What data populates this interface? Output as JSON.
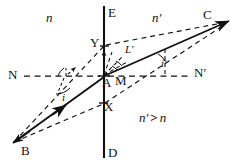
{
  "figure": {
    "background_color": "#ffffff",
    "ink_color": "#111111",
    "width": 232,
    "height": 165
  },
  "labels": {
    "interface_top": "E",
    "interface_bottom": "D",
    "normal_left": "N",
    "normal_right": "N′",
    "point_incident": "B",
    "point_refracted": "C",
    "point_upper": "Y",
    "point_vertex": "A",
    "point_mid": "M",
    "point_lower": "X",
    "index_left": "n",
    "index_right": "n′",
    "angle_incidence_upper": "i",
    "angle_incidence_lower": "i",
    "angle_refraction_upper": "L′",
    "angle_refraction_lower": "i′",
    "relation": "n′ > n",
    "relation_left": "n′",
    "relation_op": ">",
    "relation_right": "n"
  },
  "geometry": {
    "interface_x": 104,
    "interface_y_top": 6,
    "interface_y_bottom": 158,
    "normal_y": 76,
    "normal_x_left": 24,
    "normal_x_right": 192,
    "point_A": [
      104,
      76
    ],
    "point_Y": [
      104,
      46
    ],
    "point_X": [
      104,
      103
    ],
    "point_B": [
      14,
      142
    ],
    "point_C": [
      228,
      22
    ]
  },
  "elements": {
    "ray_incident": "B to A (solid, arrow at A and at B)",
    "ray_refracted": "A to C (solid, arrow at C)",
    "dashed_paths": [
      "B to Y to C",
      "B to X to C",
      "N to A (normal, dashed)",
      "A to N' (normal, dashed)",
      "Y to C (dashed)",
      "Y tick marks from A"
    ]
  }
}
